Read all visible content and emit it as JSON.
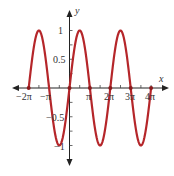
{
  "chart_data": {
    "type": "line",
    "title": "",
    "function": "y = sin(x)",
    "xlabel": "x",
    "ylabel": "y",
    "xlim": [
      -6.9,
      14.5
    ],
    "ylim": [
      -1.35,
      1.35
    ],
    "x_tick_labels": [
      "-2π",
      "-π",
      "π",
      "2π",
      "3π",
      "4π"
    ],
    "x_tick_values": [
      -6.2832,
      -3.1416,
      3.1416,
      6.2832,
      9.4248,
      12.5664
    ],
    "y_tick_labels": [
      "1",
      "0.5",
      "-0.5",
      "-1"
    ],
    "y_tick_values": [
      1,
      0.5,
      -0.5,
      -1
    ],
    "grid": false,
    "series": [
      {
        "name": "sin(x)",
        "color": "#b5262a",
        "x_range": [
          -6.2832,
          12.5664
        ],
        "key_points": [
          {
            "x": "-2π",
            "y": 0
          },
          {
            "x": "-3π/2",
            "y": 1
          },
          {
            "x": "-π",
            "y": 0
          },
          {
            "x": "-π/2",
            "y": -1
          },
          {
            "x": "0",
            "y": 0
          },
          {
            "x": "π/2",
            "y": 1
          },
          {
            "x": "π",
            "y": 0
          },
          {
            "x": "3π/2",
            "y": -1
          },
          {
            "x": "2π",
            "y": 0
          },
          {
            "x": "5π/2",
            "y": 1
          },
          {
            "x": "3π",
            "y": 0
          },
          {
            "x": "7π/2",
            "y": -1
          },
          {
            "x": "4π",
            "y": 0
          }
        ]
      }
    ],
    "marked_points": [
      "-2π",
      "0",
      "π",
      "2π",
      "3π",
      "4π"
    ]
  },
  "labels": {
    "x_axis": "x",
    "y_axis": "y",
    "xt": [
      "−2π",
      "−π",
      "π",
      "2π",
      "3π",
      "4π"
    ],
    "yt": [
      "1",
      "0.5",
      "−0.5",
      "−1"
    ]
  }
}
